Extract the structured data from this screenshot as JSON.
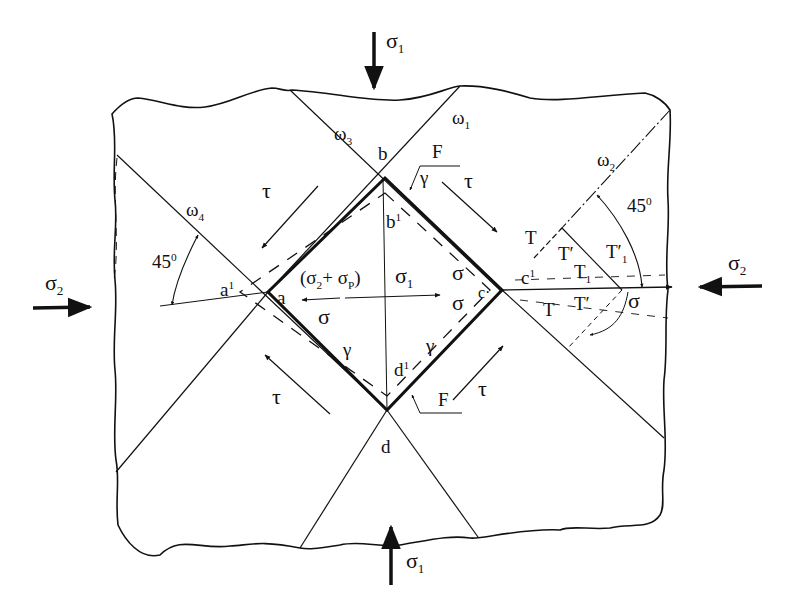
{
  "figure": {
    "colors": {
      "ink": "#111111",
      "background": "#ffffff"
    }
  },
  "loads": {
    "top": {
      "symbol": "σ",
      "subscript": "1",
      "direction": "down"
    },
    "bottom": {
      "symbol": "σ",
      "subscript": "1",
      "direction": "up"
    },
    "left": {
      "symbol": "σ",
      "subscript": "2",
      "direction": "right"
    },
    "right": {
      "symbol": "σ",
      "subscript": "2",
      "direction": "left"
    }
  },
  "planes": [
    {
      "symbol": "ω",
      "subscript": "1"
    },
    {
      "symbol": "ω",
      "subscript": "2"
    },
    {
      "symbol": "ω",
      "subscript": "3"
    },
    {
      "symbol": "ω",
      "subscript": "4"
    }
  ],
  "vertices": {
    "a": "a",
    "b": "b",
    "c": "c",
    "d": "d",
    "a_prime": {
      "base": "a",
      "sup": "1"
    },
    "b_prime": {
      "base": "b",
      "sup": "1"
    },
    "c_prime": {
      "base": "c",
      "sup": "1"
    },
    "d_prime": {
      "base": "d",
      "sup": "1"
    },
    "c_dot": "c·"
  },
  "angles": {
    "left": {
      "value": "45",
      "unit": "0"
    },
    "right": {
      "value": "45",
      "unit": "0"
    }
  },
  "inner_labels": {
    "sum_stress": {
      "open": "(σ",
      "s2": "2",
      "plus": "+ σ",
      "sp": "P",
      "close": ")"
    },
    "sigma1": {
      "symbol": "σ",
      "subscript": "1"
    },
    "sigma": "σ",
    "tau": "τ",
    "gamma": "γ",
    "F": "F"
  },
  "right_labels": {
    "T": "T",
    "T_prime": "T′",
    "T1": {
      "base": "T",
      "sub": "1"
    },
    "T1_prime": {
      "base": "T′",
      "sub": "1"
    },
    "sigma": "σ"
  }
}
